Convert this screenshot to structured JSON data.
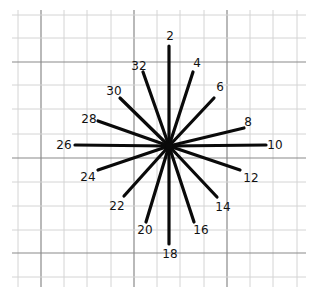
{
  "diagram": {
    "type": "radial-star",
    "center": [
      169,
      146
    ],
    "ray_color": "#0a0a0a",
    "grid": {
      "minor_color": "#d4d4d4",
      "major_color": "#8a8a8a",
      "x_lines": [
        18,
        41,
        64,
        87,
        111,
        134,
        157,
        180,
        204,
        227,
        250,
        273,
        297
      ],
      "y_lines": [
        15,
        38,
        62,
        85,
        109,
        134,
        158,
        182,
        206,
        230,
        253,
        277
      ],
      "major_x": [
        41,
        134,
        227
      ],
      "major_y": [
        62,
        158,
        253
      ],
      "x_extent": [
        12,
        306
      ],
      "y_extent": [
        10,
        287
      ]
    },
    "rays": [
      {
        "label": "2",
        "end": [
          169,
          46
        ],
        "label_pos": [
          170,
          40
        ]
      },
      {
        "label": "4",
        "end": [
          193,
          72
        ],
        "label_pos": [
          197,
          67
        ]
      },
      {
        "label": "6",
        "end": [
          214,
          98
        ],
        "label_pos": [
          220,
          91
        ]
      },
      {
        "label": "8",
        "end": [
          244,
          128
        ],
        "label_pos": [
          248,
          126
        ]
      },
      {
        "label": "10",
        "end": [
          266,
          145
        ],
        "label_pos": [
          275,
          149
        ]
      },
      {
        "label": "12",
        "end": [
          240,
          170
        ],
        "label_pos": [
          251,
          182
        ]
      },
      {
        "label": "14",
        "end": [
          217,
          197
        ],
        "label_pos": [
          223,
          211
        ]
      },
      {
        "label": "16",
        "end": [
          194,
          222
        ],
        "label_pos": [
          201,
          234
        ]
      },
      {
        "label": "18",
        "end": [
          169,
          244
        ],
        "label_pos": [
          170,
          258
        ]
      },
      {
        "label": "20",
        "end": [
          146,
          222
        ],
        "label_pos": [
          145,
          234
        ]
      },
      {
        "label": "22",
        "end": [
          124,
          196
        ],
        "label_pos": [
          117,
          210
        ]
      },
      {
        "label": "24",
        "end": [
          98,
          170
        ],
        "label_pos": [
          88,
          181
        ]
      },
      {
        "label": "26",
        "end": [
          75,
          145
        ],
        "label_pos": [
          64,
          149
        ]
      },
      {
        "label": "28",
        "end": [
          98,
          121
        ],
        "label_pos": [
          89,
          123
        ]
      },
      {
        "label": "30",
        "end": [
          120,
          98
        ],
        "label_pos": [
          114,
          95
        ]
      },
      {
        "label": "32",
        "end": [
          143,
          72
        ],
        "label_pos": [
          139,
          70
        ]
      }
    ]
  }
}
